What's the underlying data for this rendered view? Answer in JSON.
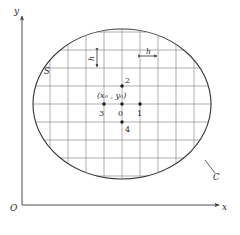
{
  "figure": {
    "caption": ""
  },
  "axes": {
    "x_label": "x",
    "y_label": "y",
    "origin_label": "O",
    "x_axis_y": 205,
    "y_axis_x": 22,
    "x_axis_end": 222,
    "y_axis_top": 13
  },
  "region": {
    "boundary_label": "C",
    "interior_label": "S",
    "center_x": 122,
    "center_y": 104,
    "radius_x": 90,
    "radius_y": 76
  },
  "grid": {
    "spacing": 18,
    "color": "#8c8c8c",
    "boundary_color": "#3a3a3a"
  },
  "spacing_markers": {
    "vertical_label": "h",
    "horizontal_label": "h"
  },
  "stencil": {
    "center_coord_label": "(x₀ ,  y₀)",
    "points": [
      {
        "id": "0",
        "label": "0",
        "x": 122,
        "y": 104,
        "label_dx": -4,
        "label_dy": 6
      },
      {
        "id": "1",
        "label": "1",
        "x": 140,
        "y": 104,
        "label_dx": -3,
        "label_dy": 6
      },
      {
        "id": "2",
        "label": "2",
        "x": 122,
        "y": 86,
        "label_dx": 3,
        "label_dy": -12
      },
      {
        "id": "3",
        "label": "3",
        "x": 104,
        "y": 104,
        "label_dx": -5,
        "label_dy": 6
      },
      {
        "id": "4",
        "label": "4",
        "x": 122,
        "y": 122,
        "label_dx": 3,
        "label_dy": 2
      }
    ]
  }
}
